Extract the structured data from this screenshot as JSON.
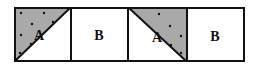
{
  "diagram": {
    "colors": {
      "stroke": "#111111",
      "shade": "#a9a9a9",
      "background": "#ffffff"
    },
    "tiles": [
      {
        "label": "A",
        "type": "shaded-triangle",
        "diagonal": "bottom-left-to-top-right",
        "shaded_half": "upper-left"
      },
      {
        "label": "B",
        "type": "plain"
      },
      {
        "label": "A",
        "type": "shaded-triangle",
        "diagonal": "top-left-to-bottom-right",
        "shaded_half": "upper-right"
      },
      {
        "label": "B",
        "type": "plain"
      }
    ]
  }
}
